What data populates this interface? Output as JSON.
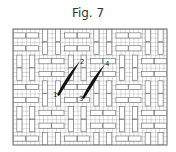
{
  "figure": {
    "title": "Fig. 7",
    "grid": {
      "left": 13,
      "top": 29,
      "right": 167,
      "bottom": 145,
      "cell": 4.3,
      "line_color": "#777777",
      "block_color": "#ffffff"
    },
    "stitches": [
      {
        "start_label": "1",
        "end_label": "2",
        "x1": 59,
        "y1": 93,
        "x2": 78,
        "y2": 63
      },
      {
        "start_label": "3",
        "end_label": "4",
        "x1": 84,
        "y1": 96,
        "x2": 103,
        "y2": 66
      }
    ],
    "labels": {
      "l1": "1",
      "l2": "2",
      "l3": "3",
      "l4": "4"
    },
    "stitch_color": "#111111"
  }
}
